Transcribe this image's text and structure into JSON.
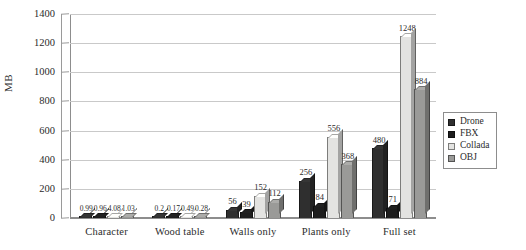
{
  "chart_data": {
    "type": "bar",
    "title": "",
    "xlabel": "",
    "ylabel": "MB",
    "ylim": [
      0,
      1400
    ],
    "yticks": [
      0,
      200,
      400,
      600,
      800,
      1000,
      1200,
      1400
    ],
    "grid": true,
    "legend_position": "right",
    "categories": [
      "Character",
      "Wood table",
      "Walls only",
      "Plants only",
      "Full set"
    ],
    "series": [
      {
        "name": "Drone",
        "color": "#2f2f2f",
        "values": [
          0.99,
          0.2,
          56,
          256,
          480
        ],
        "labels": [
          "0.99",
          "0.2",
          "56",
          "256",
          "480"
        ]
      },
      {
        "name": "FBX",
        "color": "#1d1d1d",
        "values": [
          0.96,
          0.17,
          39,
          84,
          71
        ],
        "labels": [
          "0.96",
          "0.17",
          "39",
          "84",
          "71"
        ]
      },
      {
        "name": "Collada",
        "color": "#e3e3e1",
        "values": [
          4.08,
          0.49,
          152,
          556,
          1248
        ],
        "labels": [
          "4.08",
          "0.49",
          "152",
          "556",
          "1248"
        ]
      },
      {
        "name": "OBJ",
        "color": "#9a9a98",
        "values": [
          1.03,
          0.28,
          112,
          368,
          884
        ],
        "labels": [
          "1.03",
          "0.28",
          "112",
          "368",
          "884"
        ]
      }
    ]
  }
}
